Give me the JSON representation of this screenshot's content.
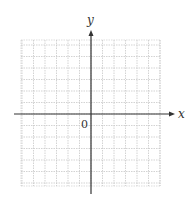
{
  "diagram": {
    "type": "coordinate-plane",
    "x_axis_label": "x",
    "y_axis_label": "y",
    "origin_label": "0",
    "grid": {
      "unit_px": 11.5,
      "origin_px": [
        91,
        114
      ],
      "box_px": {
        "left": 21,
        "top": 40,
        "right": 160,
        "bottom": 186
      },
      "line_color": "#c8c8c8",
      "style": "dotted"
    },
    "axes": {
      "x_start_px": 14,
      "x_end_px": 175,
      "y_start_px": 30,
      "y_end_px": 194,
      "color": "#333333"
    }
  }
}
